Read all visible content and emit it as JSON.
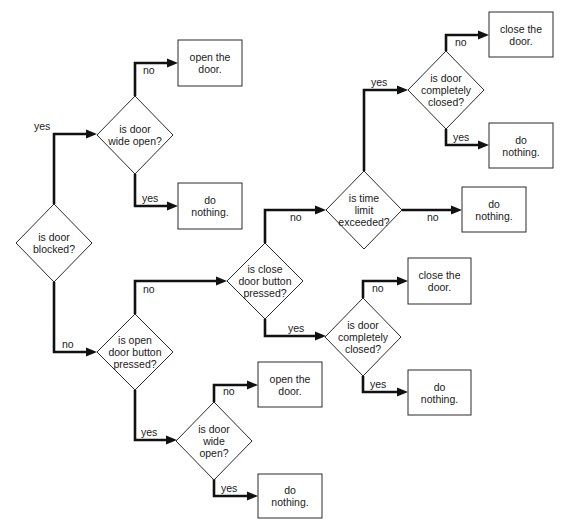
{
  "diagram": {
    "colors": {
      "line": "#111111",
      "shape_stroke": "#2a2a2a",
      "background": "#ffffff",
      "text": "#1a1a1a"
    },
    "nodes": [
      {
        "id": "d_blocked",
        "type": "decision",
        "lines": [
          "is door",
          "blocked?"
        ],
        "cx": 54,
        "cy": 243,
        "hw": 38,
        "hh": 39
      },
      {
        "id": "d_wide1",
        "type": "decision",
        "lines": [
          "is door",
          "wide open?"
        ],
        "cx": 135,
        "cy": 135,
        "hw": 38,
        "hh": 39
      },
      {
        "id": "a_open1",
        "type": "action",
        "lines": [
          "open the",
          "door."
        ],
        "x": 178,
        "y": 40,
        "w": 64,
        "h": 46
      },
      {
        "id": "a_nothing1",
        "type": "action",
        "lines": [
          "do",
          "nothing."
        ],
        "x": 178,
        "y": 183,
        "w": 64,
        "h": 46
      },
      {
        "id": "d_openbtn",
        "type": "decision",
        "lines": [
          "is open",
          "door button",
          "pressed?"
        ],
        "cx": 135,
        "cy": 352,
        "hw": 38,
        "hh": 38
      },
      {
        "id": "d_closebtn",
        "type": "decision",
        "lines": [
          "is close",
          "door button",
          "pressed?"
        ],
        "cx": 265,
        "cy": 281,
        "hw": 38,
        "hh": 38
      },
      {
        "id": "d_time",
        "type": "decision",
        "lines": [
          "is time",
          "limit",
          "exceeded?"
        ],
        "cx": 364,
        "cy": 210,
        "hw": 38,
        "hh": 39
      },
      {
        "id": "a_nothing_time",
        "type": "action",
        "lines": [
          "do",
          "nothing."
        ],
        "x": 462,
        "y": 187,
        "w": 64,
        "h": 45
      },
      {
        "id": "d_closed1",
        "type": "decision",
        "lines": [
          "is door",
          "completely",
          "closed?"
        ],
        "cx": 446,
        "cy": 90,
        "hw": 38,
        "hh": 39
      },
      {
        "id": "a_close1",
        "type": "action",
        "lines": [
          "close the",
          "door."
        ],
        "x": 489,
        "y": 12,
        "w": 64,
        "h": 45
      },
      {
        "id": "a_nothing2",
        "type": "action",
        "lines": [
          "do",
          "nothing."
        ],
        "x": 489,
        "y": 123,
        "w": 64,
        "h": 45
      },
      {
        "id": "d_closed2",
        "type": "decision",
        "lines": [
          "is door",
          "completely",
          "closed?"
        ],
        "cx": 363,
        "cy": 337,
        "hw": 38,
        "hh": 39
      },
      {
        "id": "a_close2",
        "type": "action",
        "lines": [
          "close the",
          "door."
        ],
        "x": 408,
        "y": 258,
        "w": 63,
        "h": 46
      },
      {
        "id": "a_nothing3",
        "type": "action",
        "lines": [
          "do",
          "nothing."
        ],
        "x": 408,
        "y": 370,
        "w": 63,
        "h": 45
      },
      {
        "id": "d_wide2",
        "type": "decision",
        "lines": [
          "is door",
          "wide",
          "open?"
        ],
        "cx": 214,
        "cy": 441,
        "hw": 38,
        "hh": 39
      },
      {
        "id": "a_open2",
        "type": "action",
        "lines": [
          "open the",
          "door."
        ],
        "x": 258,
        "y": 362,
        "w": 64,
        "h": 45
      },
      {
        "id": "a_nothing4",
        "type": "action",
        "lines": [
          "do",
          "nothing."
        ],
        "x": 258,
        "y": 474,
        "w": 64,
        "h": 44
      }
    ],
    "edges": [
      {
        "from": "d_blocked",
        "to": "d_wide1",
        "label": "yes",
        "points": [
          [
            54,
            204
          ],
          [
            54,
            134
          ],
          [
            97,
            134
          ]
        ],
        "label_x": 34,
        "label_y": 130
      },
      {
        "from": "d_blocked",
        "to": "d_openbtn",
        "label": "no",
        "points": [
          [
            54,
            282
          ],
          [
            54,
            352
          ],
          [
            97,
            352
          ]
        ],
        "label_x": 62,
        "label_y": 348
      },
      {
        "from": "d_wide1",
        "to": "a_open1",
        "label": "no",
        "points": [
          [
            135,
            96
          ],
          [
            135,
            63
          ],
          [
            178,
            63
          ]
        ],
        "label_x": 143,
        "label_y": 74
      },
      {
        "from": "d_wide1",
        "to": "a_nothing1",
        "label": "yes",
        "points": [
          [
            135,
            174
          ],
          [
            135,
            206
          ],
          [
            178,
            206
          ]
        ],
        "label_x": 142,
        "label_y": 202
      },
      {
        "from": "d_openbtn",
        "to": "d_closebtn",
        "label": "no",
        "points": [
          [
            135,
            314
          ],
          [
            135,
            281
          ],
          [
            227,
            281
          ]
        ],
        "label_x": 143,
        "label_y": 293
      },
      {
        "from": "d_openbtn",
        "to": "d_wide2",
        "label": "yes",
        "points": [
          [
            135,
            390
          ],
          [
            135,
            440
          ],
          [
            177,
            440
          ]
        ],
        "label_x": 141,
        "label_y": 436
      },
      {
        "from": "d_closebtn",
        "to": "d_time",
        "label": "no",
        "points": [
          [
            265,
            243
          ],
          [
            265,
            210
          ],
          [
            326,
            210
          ]
        ],
        "label_x": 290,
        "label_y": 221
      },
      {
        "from": "d_closebtn",
        "to": "d_closed2",
        "label": "yes",
        "points": [
          [
            265,
            319
          ],
          [
            265,
            336
          ],
          [
            326,
            336
          ]
        ],
        "label_x": 288,
        "label_y": 332
      },
      {
        "from": "d_time",
        "to": "d_closed1",
        "label": "yes",
        "points": [
          [
            364,
            171
          ],
          [
            364,
            90
          ],
          [
            408,
            90
          ]
        ],
        "label_x": 371,
        "label_y": 86
      },
      {
        "from": "d_time",
        "to": "a_nothing_time",
        "label": "no",
        "points": [
          [
            402,
            210
          ],
          [
            462,
            210
          ]
        ],
        "label_x": 427,
        "label_y": 221
      },
      {
        "from": "d_closed1",
        "to": "a_close1",
        "label": "no",
        "points": [
          [
            446,
            51
          ],
          [
            446,
            35
          ],
          [
            489,
            35
          ]
        ],
        "label_x": 455,
        "label_y": 46
      },
      {
        "from": "d_closed1",
        "to": "a_nothing2",
        "label": "yes",
        "points": [
          [
            446,
            129
          ],
          [
            446,
            145
          ],
          [
            489,
            145
          ]
        ],
        "label_x": 453,
        "label_y": 141
      },
      {
        "from": "d_closed2",
        "to": "a_close2",
        "label": "no",
        "points": [
          [
            363,
            298
          ],
          [
            363,
            281
          ],
          [
            408,
            281
          ]
        ],
        "label_x": 372,
        "label_y": 292
      },
      {
        "from": "d_closed2",
        "to": "a_nothing3",
        "label": "yes",
        "points": [
          [
            363,
            376
          ],
          [
            363,
            392
          ],
          [
            408,
            392
          ]
        ],
        "label_x": 370,
        "label_y": 388
      },
      {
        "from": "d_wide2",
        "to": "a_open2",
        "label": "no",
        "points": [
          [
            214,
            402
          ],
          [
            214,
            385
          ],
          [
            258,
            385
          ]
        ],
        "label_x": 223,
        "label_y": 395
      },
      {
        "from": "d_wide2",
        "to": "a_nothing4",
        "label": "yes",
        "points": [
          [
            214,
            479
          ],
          [
            214,
            496
          ],
          [
            258,
            496
          ]
        ],
        "label_x": 221,
        "label_y": 492
      }
    ]
  }
}
